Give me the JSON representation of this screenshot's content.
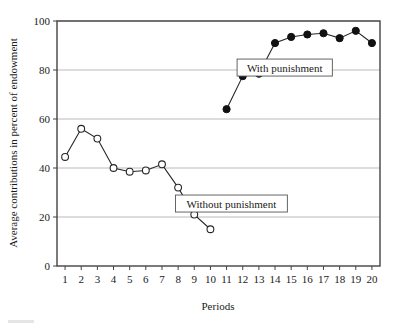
{
  "chart_data": {
    "type": "line",
    "title": "",
    "xlabel": "Periods",
    "ylabel": "Average contributions in percent of endowment",
    "x": [
      1,
      2,
      3,
      4,
      5,
      6,
      7,
      8,
      9,
      10,
      11,
      12,
      13,
      14,
      15,
      16,
      17,
      18,
      19,
      20
    ],
    "xlim": [
      0.5,
      20.5
    ],
    "ylim": [
      0,
      100
    ],
    "yticks": [
      0,
      20,
      40,
      60,
      80,
      100
    ],
    "xticks": [
      1,
      2,
      3,
      4,
      5,
      6,
      7,
      8,
      9,
      10,
      11,
      12,
      13,
      14,
      15,
      16,
      17,
      18,
      19,
      20
    ],
    "grid": "horizontal",
    "legend_position": "inline-annotations",
    "series": [
      {
        "name": "Without punishment",
        "marker": "open-circle",
        "x": [
          1,
          2,
          3,
          4,
          5,
          6,
          7,
          8,
          9,
          10
        ],
        "values": [
          44.5,
          56,
          52,
          40,
          38.5,
          39,
          41.5,
          32,
          21,
          15
        ]
      },
      {
        "name": "With punishment",
        "marker": "filled-circle",
        "x": [
          11,
          12,
          13,
          14,
          15,
          16,
          17,
          18,
          19,
          20
        ],
        "values": [
          64,
          77.5,
          78.5,
          91,
          93.5,
          94.5,
          95,
          93,
          96,
          91
        ]
      }
    ],
    "annotations": [
      {
        "text": "With punishment",
        "x": 14.6,
        "y": 81
      },
      {
        "text": "Without punishment",
        "x": 11.3,
        "y": 25.5
      }
    ]
  },
  "axis": {
    "y_tick_labels": [
      "100",
      "80",
      "60",
      "40",
      "20",
      "0"
    ],
    "x_tick_labels": [
      "1",
      "2",
      "3",
      "4",
      "5",
      "6",
      "7",
      "8",
      "9",
      "10",
      "11",
      "12",
      "13",
      "14",
      "15",
      "16",
      "17",
      "18",
      "19",
      "20"
    ],
    "y_title": "Average contributions in percent of endowment",
    "x_title": "Periods"
  },
  "colors": {
    "line": "#262626",
    "marker_fill": "#111111",
    "marker_open_fill": "#ffffff",
    "grid": "#a8a8a8",
    "frame": "#444444",
    "background": "#ffffff"
  }
}
